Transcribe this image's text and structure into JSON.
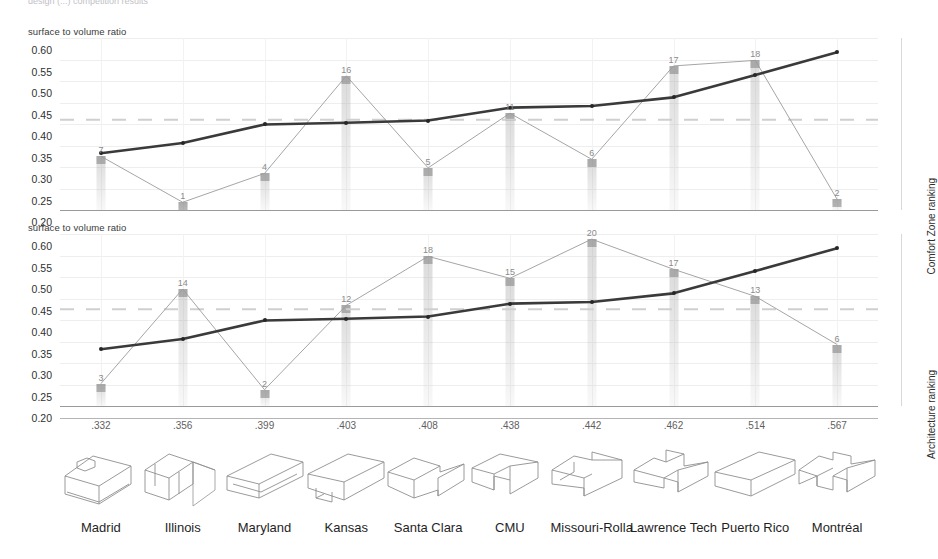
{
  "figure": {
    "cut_title": "design (...)  competition  results",
    "axis_title": "surface to volume ratio",
    "y_ticks": [
      "0.60",
      "0.55",
      "0.50",
      "0.45",
      "0.40",
      "0.35",
      "0.30",
      "0.25",
      "0.20"
    ],
    "y_min": 0.2,
    "y_max": 0.6,
    "side_label_comfort": "Comfort Zone ranking",
    "side_label_arch": "Architecture ranking"
  },
  "chart_data": [
    {
      "type": "line",
      "title": "Comfort Zone ranking",
      "ylabel": "surface to volume ratio",
      "xlabel": "",
      "ylim": [
        0.2,
        0.6
      ],
      "grid": true,
      "legend": "none",
      "categories": [
        "Madrid",
        "Illinois",
        "Maryland",
        "Kansas",
        "Santa Clara",
        "CMU",
        "Missouri-Rolla",
        "Lawrence Tech",
        "Puerto Rico",
        "Montréal"
      ],
      "x_ticks": [
        ".332",
        ".356",
        ".399",
        ".403",
        ".408",
        ".438",
        ".442",
        ".462",
        ".514",
        ".567"
      ],
      "series": [
        {
          "name": "surface to volume ratio",
          "style": "thick-dark-line",
          "values": [
            0.332,
            0.356,
            0.399,
            0.403,
            0.408,
            0.438,
            0.442,
            0.462,
            0.514,
            0.567
          ]
        },
        {
          "name": "Comfort Zone ranking (mapped)",
          "style": "thin-light-line",
          "rank_labels": [
            "7",
            "1",
            "4",
            "16",
            "5",
            "11",
            "6",
            "17",
            "18",
            "2"
          ],
          "values": [
            0.325,
            0.218,
            0.285,
            0.512,
            0.298,
            0.425,
            0.318,
            0.535,
            0.548,
            0.225
          ]
        }
      ],
      "reference_line": 0.41
    },
    {
      "type": "line",
      "title": "Architecture ranking",
      "ylabel": "surface to volume ratio",
      "xlabel": "",
      "ylim": [
        0.2,
        0.6
      ],
      "grid": true,
      "legend": "none",
      "categories": [
        "Madrid",
        "Illinois",
        "Maryland",
        "Kansas",
        "Santa Clara",
        "CMU",
        "Missouri-Rolla",
        "Lawrence Tech",
        "Puerto Rico",
        "Montréal"
      ],
      "x_ticks": [
        ".332",
        ".356",
        ".399",
        ".403",
        ".408",
        ".438",
        ".442",
        ".462",
        ".514",
        ".567"
      ],
      "series": [
        {
          "name": "surface to volume ratio",
          "style": "thick-dark-line",
          "values": [
            0.332,
            0.356,
            0.399,
            0.403,
            0.408,
            0.438,
            0.442,
            0.462,
            0.514,
            0.567
          ]
        },
        {
          "name": "Architecture ranking (mapped)",
          "style": "thin-light-line",
          "rank_labels": [
            "3",
            "14",
            "2",
            "12",
            "18",
            "15",
            "20",
            "17",
            "13",
            "6"
          ],
          "values": [
            0.252,
            0.472,
            0.238,
            0.434,
            0.548,
            0.497,
            0.588,
            0.518,
            0.455,
            0.343
          ]
        }
      ],
      "reference_line": 0.425
    }
  ],
  "entries": [
    {
      "name": "Madrid",
      "ratio": ".332",
      "icon": "house-gable-dormer-sketch"
    },
    {
      "name": "Illinois",
      "ratio": ".356",
      "icon": "house-double-gable-sketch"
    },
    {
      "name": "Maryland",
      "ratio": ".399",
      "icon": "house-long-shed-sketch"
    },
    {
      "name": "Kansas",
      "ratio": ".403",
      "icon": "house-notched-bar-sketch"
    },
    {
      "name": "Santa Clara",
      "ratio": ".408",
      "icon": "house-offset-twin-sketch"
    },
    {
      "name": "CMU",
      "ratio": ".438",
      "icon": "house-open-court-sketch"
    },
    {
      "name": "Missouri-Rolla",
      "ratio": ".442",
      "icon": "house-stepped-wing-sketch"
    },
    {
      "name": "Lawrence Tech",
      "ratio": ".462",
      "icon": "house-cross-ridge-sketch"
    },
    {
      "name": "Puerto Rico",
      "ratio": ".514",
      "icon": "house-plain-box-sketch"
    },
    {
      "name": "Montréal",
      "ratio": ".567",
      "icon": "house-split-mass-sketch"
    }
  ]
}
